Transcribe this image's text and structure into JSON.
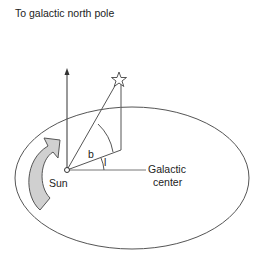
{
  "diagram": {
    "labels": {
      "north_pole": "To galactic north pole",
      "sun": "Sun",
      "galactic_center_line1": "Galactic",
      "galactic_center_line2": "center",
      "latitude": "b",
      "longitude": "l"
    },
    "colors": {
      "line": "#555555",
      "arrow_fill": "#d0d0d0",
      "text": "#222222"
    }
  }
}
